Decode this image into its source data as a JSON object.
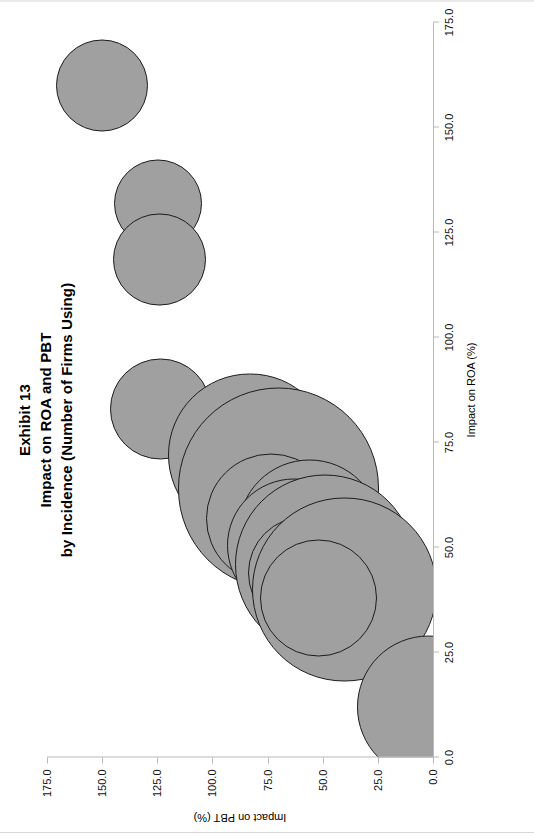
{
  "title": {
    "lines": [
      "Exhibit 13",
      "Impact on ROA and PBT",
      "by Incidence (Number of Firms Using)"
    ]
  },
  "chart_data": {
    "type": "scatter",
    "subtype": "bubble",
    "xlabel": "Impact on ROA (%)",
    "ylabel": "Impact on PBT (%)",
    "xlim": [
      0.0,
      175.0
    ],
    "ylim": [
      0.0,
      175.0
    ],
    "xticks": [
      "0.0",
      "25.0",
      "50.0",
      "75.0",
      "100.0",
      "125.0",
      "150.0",
      "175.0"
    ],
    "yticks": [
      "0.0",
      "25.0",
      "50.0",
      "75.0",
      "100.0",
      "125.0",
      "150.0",
      "175.0"
    ],
    "tick_values": [
      0,
      25,
      50,
      75,
      100,
      125,
      150,
      175
    ],
    "grid": false,
    "legend": false,
    "bubble_fill": "#a0a0a0",
    "bubble_stroke": "#1c1c1c",
    "size_meaning": "Number of Firms Using",
    "points": [
      {
        "x": 160.0,
        "y": 150.0,
        "size": 11.0
      },
      {
        "x": 132.0,
        "y": 124.5,
        "size": 10.5
      },
      {
        "x": 118.5,
        "y": 124.0,
        "size": 11.0
      },
      {
        "x": 83.0,
        "y": 123.5,
        "size": 12.0
      },
      {
        "x": 72.0,
        "y": 83.0,
        "size": 19.5
      },
      {
        "x": 64.0,
        "y": 70.0,
        "size": 24.0
      },
      {
        "x": 57.0,
        "y": 73.5,
        "size": 15.5
      },
      {
        "x": 54.0,
        "y": 56.0,
        "size": 17.0
      },
      {
        "x": 50.5,
        "y": 63.0,
        "size": 16.0
      },
      {
        "x": 46.0,
        "y": 49.0,
        "size": 21.5
      },
      {
        "x": 44.0,
        "y": 58.0,
        "size": 13.5
      },
      {
        "x": 40.0,
        "y": 40.0,
        "size": 22.0
      },
      {
        "x": 38.0,
        "y": 52.0,
        "size": 14.0
      },
      {
        "x": 12.0,
        "y": 2.0,
        "size": 17.0
      }
    ]
  }
}
